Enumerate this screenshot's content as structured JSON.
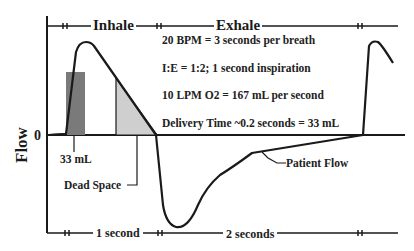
{
  "diagram": {
    "y_axis_label": "Flow",
    "zero_label": "0",
    "phases": {
      "inhale": "Inhale",
      "exhale": "Exhale"
    },
    "info_lines": [
      "20 BPM = 3 seconds per breath",
      "I:E = 1:2; 1 second inspiration",
      "10 LPM O2 = 167 mL per second",
      "Delivery Time ~0.2 seconds =  33 mL"
    ],
    "annotations": {
      "bolus": "33 mL",
      "dead_space": "Dead Space",
      "patient_flow": "Patient Flow"
    },
    "time_spans": {
      "inspiration": "1 second",
      "expiration": "2 seconds"
    },
    "colors": {
      "line": "#1a1a1a",
      "bolus_fill": "#7a7a7a",
      "dead_space_fill": "#cfcfcf",
      "background": "#ffffff"
    }
  }
}
